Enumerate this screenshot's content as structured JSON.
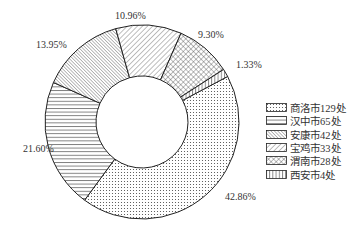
{
  "chart_data": {
    "type": "pie",
    "subtype": "donut",
    "title": "",
    "categories": [
      "商洛市129处",
      "汉中市65处",
      "安康市42处",
      "宝鸡市33处",
      "渭南市28处",
      "西安市4处"
    ],
    "values": [
      42.86,
      21.6,
      13.95,
      10.96,
      9.3,
      1.33
    ],
    "counts": [
      129,
      65,
      42,
      33,
      28,
      4
    ],
    "labels": [
      "42.86%",
      "21.60%",
      "13.95%",
      "10.96%",
      "9.30%",
      "1.33%"
    ],
    "patterns": [
      "dots",
      "horizontal-lines",
      "dense-diagonal-back",
      "diagonal-forward",
      "crosshatch",
      "vertical-lines"
    ],
    "legend_position": "right",
    "start_angle_deg": 62,
    "direction": "clockwise"
  },
  "legend": {
    "items": [
      {
        "label": "商洛市129处",
        "pattern": "dots"
      },
      {
        "label": "汉中市65处",
        "pattern": "hlines"
      },
      {
        "label": "安康市42处",
        "pattern": "bdiag"
      },
      {
        "label": "宝鸡市33处",
        "pattern": "fdiag"
      },
      {
        "label": "渭南市28处",
        "pattern": "cross"
      },
      {
        "label": "西安市4处",
        "pattern": "vlines"
      }
    ]
  },
  "colors": {
    "stroke": "#222222",
    "background": "#ffffff"
  }
}
